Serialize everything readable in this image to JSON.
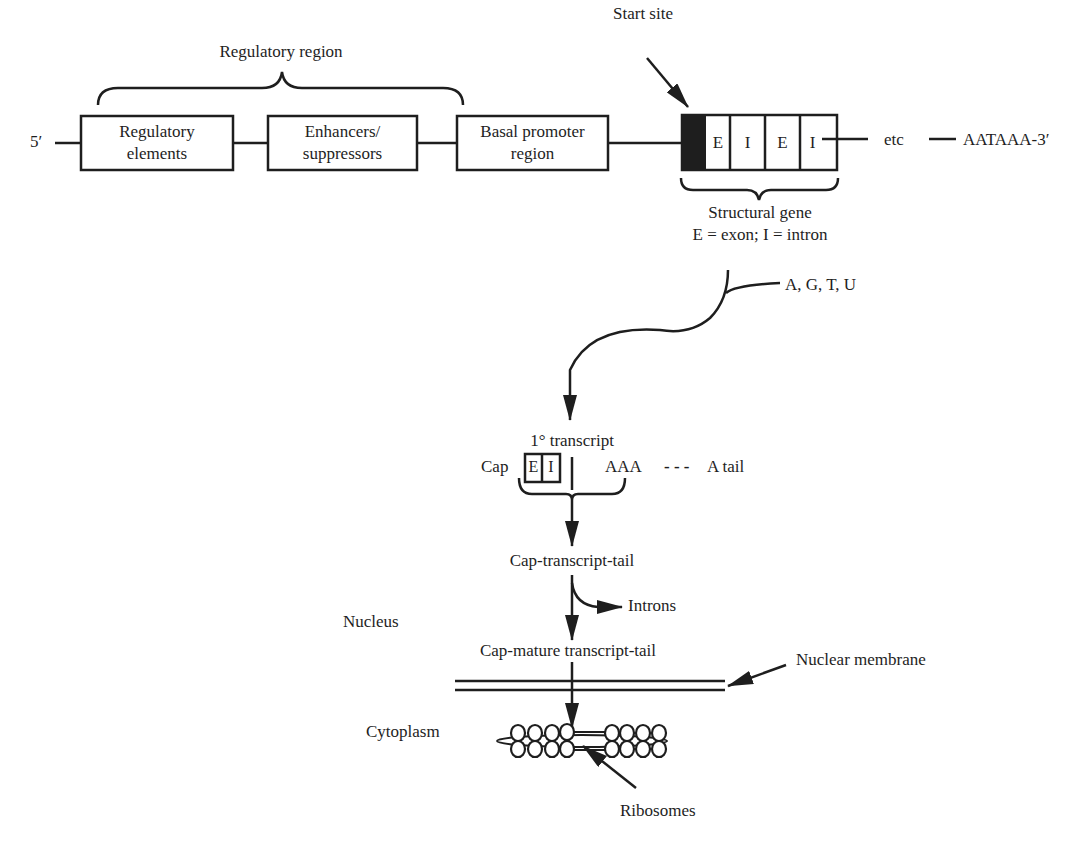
{
  "diagram": {
    "title_region": "Regulatory region",
    "five_prime": "5′",
    "boxes": [
      {
        "line1": "Regulatory",
        "line2": "elements"
      },
      {
        "line1": "Enhancers/",
        "line2": "suppressors"
      },
      {
        "line1": "Basal promoter",
        "line2": "region"
      }
    ],
    "start_site": "Start site",
    "gene_segments": [
      "E",
      "I",
      "E",
      "I"
    ],
    "etc": "etc",
    "three_prime": "AATAAA-3′",
    "structural_gene": "Structural gene",
    "legend": "E = exon; I = intron",
    "nucleotides": "A, G, T, U",
    "primary_transcript": "1° transcript",
    "cap": "Cap",
    "transcript_segments": [
      "E",
      "I"
    ],
    "poly_a": "AAA",
    "a_tail_dash": "- - -",
    "a_tail": "A tail",
    "cap_transcript_tail": "Cap-transcript-tail",
    "introns": "Introns",
    "nucleus": "Nucleus",
    "cap_mature": "Cap-mature transcript-tail",
    "nuclear_membrane": "Nuclear membrane",
    "cytoplasm": "Cytoplasm",
    "ribosomes": "Ribosomes"
  },
  "colors": {
    "ink": "#1e1e1e",
    "background": "#ffffff"
  }
}
